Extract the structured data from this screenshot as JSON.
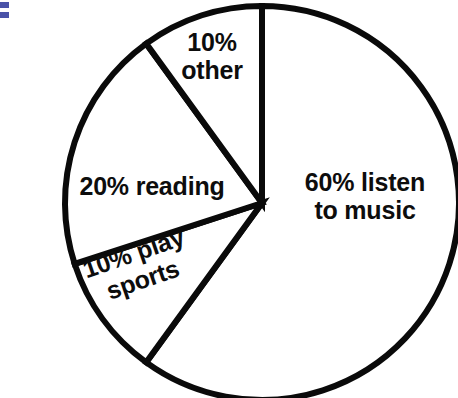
{
  "chart_data": {
    "type": "pie",
    "title": "",
    "subtitle": "",
    "xlabel": "",
    "ylabel": "",
    "legend_position": "none",
    "grid": false,
    "units": "percent",
    "total": 100,
    "categories": [
      "listen to music",
      "play sports",
      "reading",
      "other"
    ],
    "values": [
      60,
      10,
      20,
      10
    ],
    "slices": [
      {
        "label": "60% listen to music",
        "category": "listen to music",
        "value": 60,
        "percent_text": "60%",
        "label_line1": "60% listen",
        "label_line2": "to music",
        "start_angle_deg": 0,
        "end_angle_deg": 216,
        "color": "#ffffff",
        "stroke": "#0a0a0a"
      },
      {
        "label": "10% play sports",
        "category": "play sports",
        "value": 10,
        "percent_text": "10%",
        "label_line1": "10% play",
        "label_line2": "sports",
        "start_angle_deg": 216,
        "end_angle_deg": 252,
        "color": "#ffffff",
        "stroke": "#0a0a0a"
      },
      {
        "label": "20% reading",
        "category": "reading",
        "value": 20,
        "percent_text": "20%",
        "label_line1": "20% reading",
        "label_line2": "",
        "start_angle_deg": 252,
        "end_angle_deg": 324,
        "color": "#ffffff",
        "stroke": "#0a0a0a"
      },
      {
        "label": "10% other",
        "category": "other",
        "value": 10,
        "percent_text": "10%",
        "label_line1": "10%",
        "label_line2": "other",
        "start_angle_deg": 324,
        "end_angle_deg": 360,
        "color": "#ffffff",
        "stroke": "#0a0a0a"
      }
    ],
    "annotations": []
  },
  "labels": {
    "other": "10%\nother",
    "reading": "20% reading",
    "sports": "10% play\nsports",
    "music": "60% listen\nto music"
  },
  "geometry": {
    "center_x": 262,
    "center_y": 203,
    "radius": 197,
    "stroke_width": 6
  },
  "colors": {
    "background": "#ffffff",
    "stroke": "#0a0a0a",
    "text": "#0d0d0d",
    "artifact": "#4a52a8"
  }
}
